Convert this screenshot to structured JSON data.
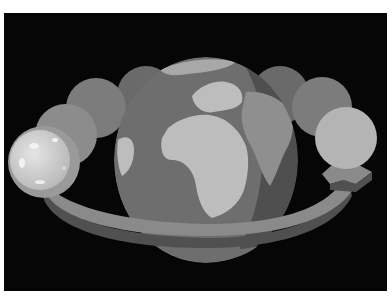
{
  "image": {
    "subject": "Moon orbiting the Earth illustration",
    "description": "Grayscale illustration: globe showing Europe/Africa/Asia, a curved orbit arrow around it, and a sequence of moon discs progressing along the orbit",
    "moon_phases_shown": 8,
    "colors": {
      "background": "#060606",
      "border": "#ffffff",
      "ocean": "#6e6e6e",
      "land": "#bdbdbd",
      "shadow_ocean": "#545454",
      "shadow_land": "#8f8f8f",
      "arrow_top": "#8a8a8a",
      "arrow_side": "#5a5a5a",
      "moon_bright": "#d6d6d6"
    }
  }
}
